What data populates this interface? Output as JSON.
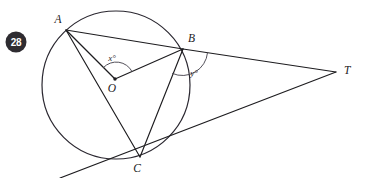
{
  "figure": {
    "problem_number": "28",
    "points": {
      "A": {
        "label": "A",
        "x": 66,
        "y": 30,
        "label_x": 58,
        "label_y": 23
      },
      "B": {
        "label": "B",
        "x": 183,
        "y": 49,
        "label_x": 188,
        "label_y": 42
      },
      "C": {
        "label": "C",
        "x": 140,
        "y": 157,
        "label_x": 137,
        "label_y": 172
      },
      "O": {
        "label": "O",
        "x": 115,
        "y": 79,
        "label_x": 112,
        "label_y": 92
      },
      "T": {
        "label": "T",
        "x": 336,
        "y": 72,
        "label_x": 344,
        "label_y": 74
      }
    },
    "circle": {
      "center_x": 116,
      "center_y": 85,
      "radius": 74
    },
    "angles": [
      {
        "name": "x",
        "label": "x°",
        "vertex": "O",
        "label_x": 112,
        "label_y": 61,
        "between": "AOB"
      },
      {
        "name": "y",
        "label": "y°",
        "vertex": "B",
        "label_x": 194,
        "label_y": 76,
        "between": "TBC"
      }
    ],
    "segments": [
      {
        "name": "AB",
        "from": "A",
        "to": "B"
      },
      {
        "name": "AO",
        "from": "A",
        "to": "O"
      },
      {
        "name": "AC",
        "from": "A",
        "to": "C"
      },
      {
        "name": "OB",
        "from": "O",
        "to": "B"
      },
      {
        "name": "BC",
        "from": "B",
        "to": "C"
      },
      {
        "name": "BT",
        "from": "B",
        "to": "T"
      },
      {
        "name": "CT",
        "from": "C",
        "to": "T"
      }
    ],
    "tangent_line": {
      "name": "tangent-at-C",
      "start_x": 60,
      "start_y": 178,
      "end_x": 336,
      "end_y": 72
    },
    "colors": {
      "ink": "#1d1c1f",
      "arc": "#4a4750",
      "badge_fill": "#2e2c31",
      "badge_text": "#ffffff",
      "background": "#ffffff"
    }
  }
}
